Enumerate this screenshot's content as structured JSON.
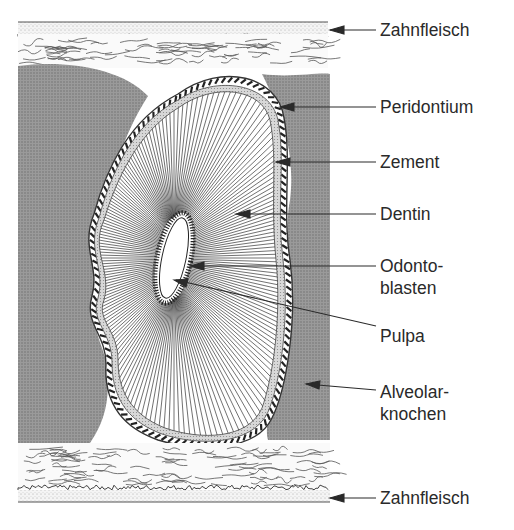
{
  "labels": {
    "zahnfleisch_top": "Zahnfleisch",
    "peridontium": "Peridontium",
    "zement": "Zement",
    "dentin": "Dentin",
    "odontoblasten_1": "Odonto-",
    "odontoblasten_2": "blasten",
    "pulpa": "Pulpa",
    "alveolar_1": "Alveolar-",
    "alveolar_2": "knochen",
    "zahnfleisch_bottom": "Zahnfleisch"
  },
  "colors": {
    "bone": "#8e8e8e",
    "ink": "#2a2a2a",
    "paper": "#ffffff",
    "cement": "#c8c8c8"
  }
}
